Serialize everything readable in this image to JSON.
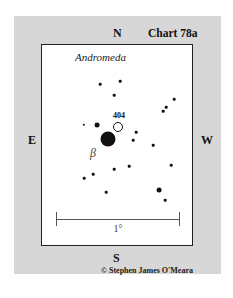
{
  "chart": {
    "title": "Chart 78a",
    "constellation": "Andromeda",
    "directions": {
      "north": "N",
      "south": "S",
      "east": "E",
      "west": "W"
    },
    "object_label": "404",
    "star_label": "β",
    "scale_label": "1°",
    "copyright": "© Stephen James O'Meara",
    "colors": {
      "background_panel": "#d7d7d7",
      "chart_field": "#ffffff",
      "stars": "#111111",
      "border": "#222222"
    }
  },
  "stars": [
    {
      "x": 100,
      "y": 84,
      "r": 1.3
    },
    {
      "x": 120,
      "y": 81,
      "r": 1.3
    },
    {
      "x": 114,
      "y": 95,
      "r": 1.3
    },
    {
      "x": 174,
      "y": 99,
      "r": 1.3
    },
    {
      "x": 166,
      "y": 107,
      "r": 1.3
    },
    {
      "x": 163,
      "y": 111,
      "r": 1.3
    },
    {
      "x": 84,
      "y": 125,
      "r": 1.2
    },
    {
      "x": 97,
      "y": 125,
      "r": 2.4
    },
    {
      "x": 136,
      "y": 132,
      "r": 1.3
    },
    {
      "x": 133,
      "y": 140,
      "r": 1.3
    },
    {
      "x": 153,
      "y": 145,
      "r": 1.3
    },
    {
      "x": 171,
      "y": 165,
      "r": 1.3
    },
    {
      "x": 129,
      "y": 166,
      "r": 1.3
    },
    {
      "x": 114,
      "y": 169,
      "r": 1.3
    },
    {
      "x": 93,
      "y": 174,
      "r": 1.3
    },
    {
      "x": 84,
      "y": 178,
      "r": 1.3
    },
    {
      "x": 106,
      "y": 192,
      "r": 1.3
    },
    {
      "x": 159,
      "y": 190,
      "r": 2.4
    },
    {
      "x": 165,
      "y": 200,
      "r": 1.3
    }
  ],
  "beta_star": {
    "x": 108,
    "y": 139,
    "r": 7.5
  },
  "object_404": {
    "x": 118,
    "y": 127,
    "r": 5
  }
}
